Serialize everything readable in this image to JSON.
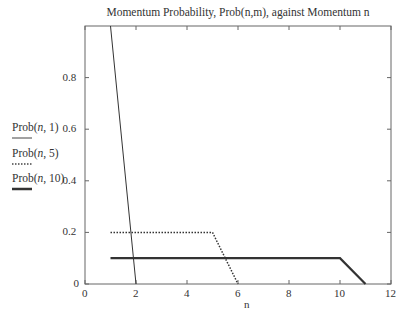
{
  "chart_data": {
    "type": "line",
    "title": "Momentum Probability, Prob(n,m), against Momentum n",
    "xlabel": "n",
    "ylabel": "",
    "xlim": [
      0,
      12
    ],
    "ylim": [
      0,
      1.0
    ],
    "x_ticks": [
      "0",
      "2",
      "4",
      "6",
      "8",
      "10",
      "12"
    ],
    "y_ticks": [
      "0",
      "0.2",
      "0.4",
      "0.6",
      "0.8"
    ],
    "grid": false,
    "legend_position": "left-outside",
    "series": [
      {
        "name": "Prob(n, 1)",
        "style": "thin-solid",
        "x": [
          1,
          2
        ],
        "y": [
          1.0,
          0
        ]
      },
      {
        "name": "Prob(n, 5)",
        "style": "dotted",
        "x": [
          1,
          5,
          6
        ],
        "y": [
          0.2,
          0.2,
          0
        ]
      },
      {
        "name": "Prob(n, 10)",
        "style": "thick-solid",
        "x": [
          1,
          10,
          11
        ],
        "y": [
          0.1,
          0.1,
          0
        ]
      }
    ]
  },
  "legend": {
    "items": [
      {
        "prefix": "Prob(",
        "var": "n",
        "suffix": ", 1)"
      },
      {
        "prefix": "Prob(",
        "var": "n",
        "suffix": ", 5)"
      },
      {
        "prefix": "Prob(",
        "var": "n",
        "suffix": ", 10)"
      }
    ]
  }
}
